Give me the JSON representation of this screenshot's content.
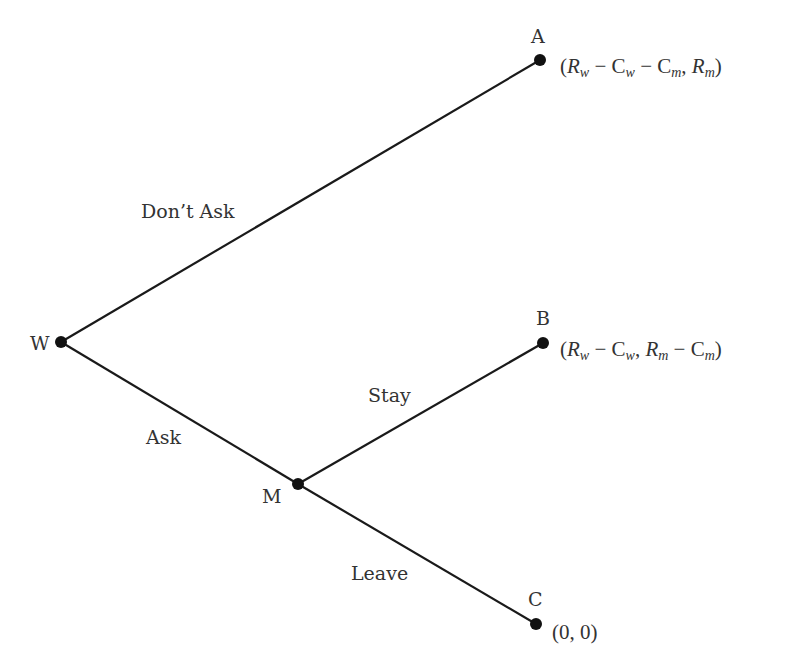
{
  "diagram": {
    "type": "game-tree",
    "nodes": [
      {
        "id": "W",
        "label": "W",
        "x": 61,
        "y": 342,
        "kind": "decision"
      },
      {
        "id": "M",
        "label": "M",
        "x": 298,
        "y": 484,
        "kind": "decision"
      },
      {
        "id": "A",
        "label": "A",
        "x": 540,
        "y": 60,
        "kind": "terminal",
        "payoff": "(R_w − C_w − C_m, R_m)"
      },
      {
        "id": "B",
        "label": "B",
        "x": 543,
        "y": 343,
        "kind": "terminal",
        "payoff": "(R_w − C_w, R_m − C_m)"
      },
      {
        "id": "C",
        "label": "C",
        "x": 536,
        "y": 624,
        "kind": "terminal",
        "payoff": "(0, 0)"
      }
    ],
    "edges": [
      {
        "from": "W",
        "to": "A",
        "label": "Don’t Ask"
      },
      {
        "from": "W",
        "to": "M",
        "label": "Ask"
      },
      {
        "from": "M",
        "to": "B",
        "label": "Stay"
      },
      {
        "from": "M",
        "to": "C",
        "label": "Leave"
      }
    ]
  },
  "labels": {
    "W": "W",
    "M": "M",
    "A": "A",
    "B": "B",
    "C": "C",
    "dont_ask": "Don’t Ask",
    "ask": "Ask",
    "stay": "Stay",
    "leave": "Leave"
  },
  "payoffs": {
    "A": {
      "open": "(",
      "R": "R",
      "w": "w",
      "minus1": " − ",
      "C1": "C",
      "w2": "w",
      "minus2": " − ",
      "C2": "C",
      "m": "m",
      "comma": ", ",
      "R2": "R",
      "m2": "m",
      "close": ")"
    },
    "B": {
      "open": "(",
      "R": "R",
      "w": "w",
      "minus1": " − ",
      "C1": "C",
      "w2": "w",
      "comma": ", ",
      "R2": "R",
      "m": "m",
      "minus2": " − ",
      "C2": "C",
      "m2": "m",
      "close": ")"
    },
    "C": {
      "text": "(0, 0)"
    }
  }
}
